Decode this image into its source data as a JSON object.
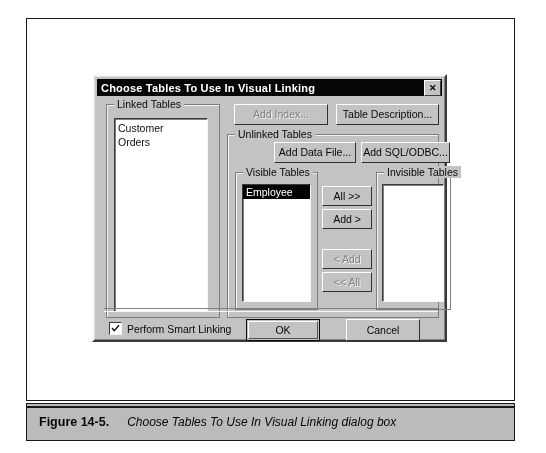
{
  "annotations": {
    "top_left": "Existing tables that are already linked",
    "top_right_line1": "List of tables that have been added to the report, but",
    "top_right_line2": "won't be visible in the Visual Linking Expert",
    "bottom": "List of tables that will appear in the Visual Linking Expert to be linked"
  },
  "dialog": {
    "title": "Choose Tables To Use In Visual Linking",
    "close_label": "✕",
    "linked_tables": {
      "label": "Linked Tables",
      "items": [
        "Customer",
        "Orders"
      ]
    },
    "top_buttons": {
      "add_index": "Add Index...",
      "table_description": "Table Description..."
    },
    "unlinked_tables": {
      "label": "Unlinked Tables",
      "add_data_file": "Add Data File...",
      "add_sql_odbc": "Add SQL/ODBC..."
    },
    "visible_tables": {
      "label": "Visible Tables",
      "items": [
        "Employee"
      ],
      "selected": "Employee"
    },
    "invisible_tables": {
      "label": "Invisible Tables",
      "items": []
    },
    "transfer_buttons": {
      "all_right": "All >>",
      "add_right": "Add >",
      "add_left": "< Add",
      "all_left": "<< All"
    },
    "smart_linking": {
      "label": "Perform Smart Linking",
      "checked": true
    },
    "footer_buttons": {
      "ok": "OK",
      "cancel": "Cancel"
    }
  },
  "caption": {
    "figure_number": "Figure 14-5.",
    "figure_title": "Choose Tables To Use In Visual Linking dialog box"
  }
}
